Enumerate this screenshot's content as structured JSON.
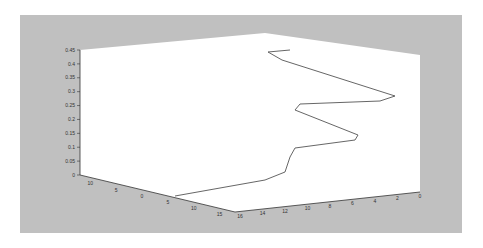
{
  "chart_data": {
    "type": "line",
    "subtype": "3d-line",
    "title": "",
    "xlabel": "",
    "ylabel": "",
    "zlabel": "",
    "grid": false,
    "legend": null,
    "axes": {
      "z": {
        "ticks": [
          "0",
          "0.05",
          "0.1",
          "0.15",
          "0.2",
          "0.25",
          "0.3",
          "0.35",
          "0.4",
          "0.45"
        ],
        "range": [
          0,
          0.45
        ]
      },
      "x": {
        "ticks": [
          "-10",
          "-5",
          "0",
          "5",
          "10",
          "15"
        ],
        "range": [
          -10,
          15
        ]
      },
      "y": {
        "ticks": [
          "16",
          "14",
          "12",
          "10",
          "8",
          "6",
          "4",
          "2",
          "0"
        ],
        "range": [
          0,
          16
        ]
      }
    },
    "series": [
      {
        "name": "trajectory",
        "color": "#555555",
        "screen_points": [
          [
            175,
            196
          ],
          [
            265,
            180
          ],
          [
            285,
            172
          ],
          [
            290,
            157
          ],
          [
            295,
            148
          ],
          [
            355,
            140
          ],
          [
            358,
            135
          ],
          [
            295,
            110
          ],
          [
            300,
            104
          ],
          [
            380,
            101
          ],
          [
            395,
            96
          ],
          [
            282,
            60
          ],
          [
            268,
            52
          ],
          [
            290,
            50
          ]
        ]
      }
    ]
  },
  "colors": {
    "figure_bg": "#c0c0c0",
    "pane": "#ffffff",
    "line": "#555555",
    "axis": "#333333"
  },
  "zaxis_labels": [
    "0.45",
    "0.4",
    "0.35",
    "0.3",
    "0.25",
    "0.2",
    "0.15",
    "0.1",
    "0.05",
    "0"
  ],
  "xaxis_labels": [
    "10",
    "5",
    "0",
    "5",
    "10",
    "15"
  ],
  "yaxis_labels": [
    "16",
    "14",
    "12",
    "10",
    "8",
    "6",
    "4",
    "2",
    "0"
  ]
}
